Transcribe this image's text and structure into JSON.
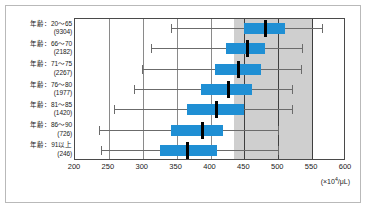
{
  "chart_data": {
    "type": "box",
    "title": "",
    "xlabel": "",
    "ylabel": "",
    "unit_label": "(×10⁴/μL)",
    "unit_prefix": "(×10",
    "unit_exponent": "4",
    "unit_suffix": "/μL)",
    "xlim": [
      200,
      600
    ],
    "xticks": [
      200,
      250,
      300,
      350,
      400,
      450,
      500,
      550,
      600
    ],
    "xticklabels": [
      "200",
      "250",
      "300",
      "350",
      "400",
      "450",
      "500",
      "550",
      "600"
    ],
    "grid": true,
    "legend": "none",
    "reference_band": {
      "label": "",
      "min": 435,
      "max": 550,
      "color": "#cfcfcf"
    },
    "reference_lines": [
      450,
      500
    ],
    "box_color": "#1f8fd4",
    "median_color": "#000000",
    "whisker_color": "#6b6b6b",
    "categories": [
      "年齢：20～65",
      "年齢：66～70",
      "年齢：71～75",
      "年齢：76～80",
      "年齢：81～85",
      "年齢：86～90",
      "年齢：91以上"
    ],
    "counts": [
      "(9304)",
      "(2182)",
      "(2267)",
      "(1977)",
      "(1420)",
      "(726)",
      "(246)"
    ],
    "boxes": [
      {
        "category": "年齢：20～65",
        "count": 9304,
        "min": 341,
        "q1": 450,
        "median": 481,
        "q3": 510,
        "max": 565
      },
      {
        "category": "年齢：66～70",
        "count": 2182,
        "min": 312,
        "q1": 423,
        "median": 454,
        "q3": 481,
        "max": 535
      },
      {
        "category": "年齢：71～75",
        "count": 2267,
        "min": 299,
        "q1": 407,
        "median": 442,
        "q3": 474,
        "max": 533
      },
      {
        "category": "年齢：76～80",
        "count": 1977,
        "min": 287,
        "q1": 386,
        "median": 427,
        "q3": 461,
        "max": 521
      },
      {
        "category": "年齢：81～85",
        "count": 1420,
        "min": 258,
        "q1": 365,
        "median": 409,
        "q3": 449,
        "max": 521
      },
      {
        "category": "年齢：86～90",
        "count": 726,
        "min": 236,
        "q1": 341,
        "median": 388,
        "q3": 419,
        "max": 500
      },
      {
        "category": "年齢：91以上",
        "count": 246,
        "min": 239,
        "q1": 325,
        "median": 366,
        "q3": 409,
        "max": 500
      }
    ]
  }
}
